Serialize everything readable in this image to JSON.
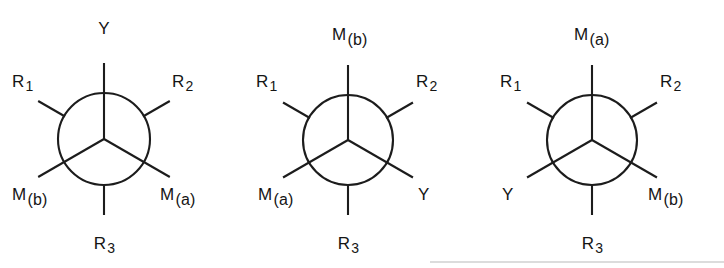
{
  "figure": {
    "type": "newman-projection-set",
    "ink_color": "#1c1c1c",
    "background_color": "#ffffff",
    "structures": [
      {
        "id": "structure-1",
        "center_x": 104,
        "center_y": 139,
        "radius": 46,
        "front_bonds": [
          {
            "name": "bond-front-up",
            "label": "Y",
            "sub": "",
            "angle_deg": 90,
            "label_x": 104,
            "label_y": 28,
            "align": "center"
          },
          {
            "name": "bond-front-lower-left",
            "label": "M",
            "sub": "(b)",
            "angle_deg": 210,
            "label_x": 12,
            "label_y": 186,
            "align": "left"
          },
          {
            "name": "bond-front-lower-right",
            "label": "M",
            "sub": "(a)",
            "angle_deg": 330,
            "label_x": 160,
            "label_y": 186,
            "align": "left"
          }
        ],
        "back_bonds": [
          {
            "name": "bond-back-upper-left",
            "label": "R",
            "sub": "1",
            "angle_deg": 150,
            "label_x": 12,
            "label_y": 73,
            "align": "left"
          },
          {
            "name": "bond-back-upper-right",
            "label": "R",
            "sub": "2",
            "angle_deg": 30,
            "label_x": 172,
            "label_y": 73,
            "align": "left"
          },
          {
            "name": "bond-back-down",
            "label": "R",
            "sub": "3",
            "angle_deg": 270,
            "label_x": 104,
            "label_y": 243,
            "align": "center"
          }
        ]
      },
      {
        "id": "structure-2",
        "center_x": 348,
        "center_y": 140,
        "radius": 45,
        "front_bonds": [
          {
            "name": "bond-front-up",
            "label": "M",
            "sub": "(b)",
            "angle_deg": 90,
            "label_x": 332,
            "label_y": 26,
            "align": "left"
          },
          {
            "name": "bond-front-lower-left",
            "label": "M",
            "sub": "(a)",
            "angle_deg": 210,
            "label_x": 258,
            "label_y": 186,
            "align": "left"
          },
          {
            "name": "bond-front-lower-right",
            "label": "Y",
            "sub": "",
            "angle_deg": 330,
            "label_x": 418,
            "label_y": 186,
            "align": "left"
          }
        ],
        "back_bonds": [
          {
            "name": "bond-back-upper-left",
            "label": "R",
            "sub": "1",
            "angle_deg": 150,
            "label_x": 256,
            "label_y": 73,
            "align": "left"
          },
          {
            "name": "bond-back-upper-right",
            "label": "R",
            "sub": "2",
            "angle_deg": 30,
            "label_x": 416,
            "label_y": 73,
            "align": "left"
          },
          {
            "name": "bond-back-down",
            "label": "R",
            "sub": "3",
            "angle_deg": 270,
            "label_x": 348,
            "label_y": 243,
            "align": "center"
          }
        ]
      },
      {
        "id": "structure-3",
        "center_x": 592,
        "center_y": 140,
        "radius": 45,
        "front_bonds": [
          {
            "name": "bond-front-up",
            "label": "M",
            "sub": "(a)",
            "angle_deg": 90,
            "label_x": 574,
            "label_y": 26,
            "align": "left"
          },
          {
            "name": "bond-front-lower-left",
            "label": "Y",
            "sub": "",
            "angle_deg": 210,
            "label_x": 502,
            "label_y": 186,
            "align": "left"
          },
          {
            "name": "bond-front-lower-right",
            "label": "M",
            "sub": "(b)",
            "angle_deg": 330,
            "label_x": 648,
            "label_y": 186,
            "align": "left"
          }
        ],
        "back_bonds": [
          {
            "name": "bond-back-upper-left",
            "label": "R",
            "sub": "1",
            "angle_deg": 150,
            "label_x": 500,
            "label_y": 73,
            "align": "left"
          },
          {
            "name": "bond-back-upper-right",
            "label": "R",
            "sub": "2",
            "angle_deg": 30,
            "label_x": 660,
            "label_y": 73,
            "align": "left"
          },
          {
            "name": "bond-back-down",
            "label": "R",
            "sub": "3",
            "angle_deg": 270,
            "label_x": 592,
            "label_y": 243,
            "align": "center"
          }
        ]
      }
    ],
    "baseline_rule": {
      "x1": 430,
      "y1": 262,
      "x2": 724,
      "y2": 262,
      "visible": true
    }
  }
}
